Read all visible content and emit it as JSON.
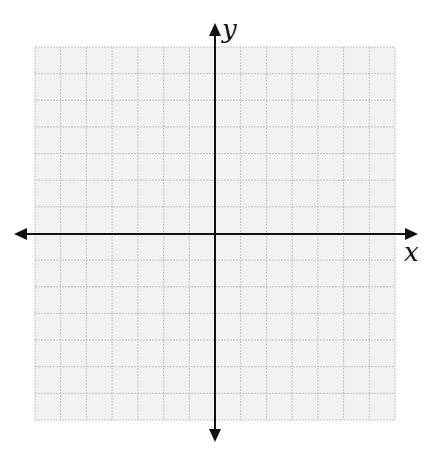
{
  "diagram": {
    "type": "coordinate-plane",
    "grid": {
      "columns": 14,
      "rows": 14,
      "left": 35,
      "top": 47,
      "right": 395,
      "bottom": 420,
      "fill_color": "#f2f2f2",
      "line_color": "#c2c2c2"
    },
    "axes": {
      "color": "#111111",
      "x_axis": {
        "label": "x",
        "y": 234,
        "start": 14,
        "end": 418,
        "arrows": [
          "left",
          "right"
        ]
      },
      "y_axis": {
        "label": "y",
        "x": 215,
        "start": 23,
        "end": 442,
        "arrows": [
          "up",
          "down"
        ]
      }
    }
  },
  "labels": {
    "x_axis_label": "x",
    "y_axis_label": "y"
  }
}
